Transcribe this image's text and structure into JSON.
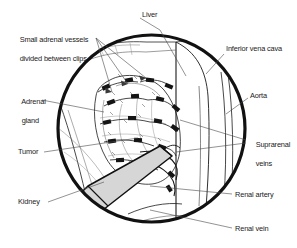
{
  "figure": {
    "kind": "surgical-illustration",
    "view": "laparoscopic circular operative field",
    "procedure": "adrenalectomy",
    "frame_shape": "circle",
    "line_color": "#111111",
    "instrument_color": "#d6d6d6",
    "background": "#ffffff"
  },
  "labels": {
    "liver": "Liver",
    "inferior_vena_cava": "Inferior vena cava",
    "aorta": "Aorta",
    "suprarenal_veins_line1": "Suprarenal",
    "suprarenal_veins_line2": "veins",
    "renal_artery": "Renal artery",
    "renal_vein": "Renal vein",
    "small_vessels_line1": "Small adrenal vessels",
    "small_vessels_line2": "divided between clips",
    "adrenal_gland_line1": "Adrenal",
    "adrenal_gland_line2": "gland",
    "tumor": "Tumor",
    "kidney": "Kidney"
  }
}
